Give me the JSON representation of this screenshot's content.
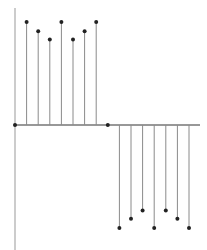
{
  "chart_data": {
    "type": "stem",
    "title": "",
    "xlabel": "",
    "ylabel": "",
    "grid": false,
    "legend": null,
    "x": [
      1,
      2,
      3,
      4,
      5,
      6,
      7,
      8,
      9,
      10,
      11,
      12,
      13,
      14,
      15,
      16
    ],
    "series": [
      {
        "name": "positive",
        "x": [
          2,
          3,
          4,
          5,
          6,
          7,
          8
        ],
        "values": [
          1.0,
          0.91,
          0.83,
          1.0,
          0.83,
          0.91,
          1.0
        ]
      },
      {
        "name": "negative",
        "x": [
          10,
          11,
          12,
          13,
          14,
          15,
          16
        ],
        "values": [
          -1.0,
          -0.91,
          -0.83,
          -1.0,
          -0.83,
          -0.91,
          -1.0
        ]
      },
      {
        "name": "zero-markers",
        "x": [
          1,
          9
        ],
        "values": [
          0,
          0
        ]
      }
    ],
    "ylim": [
      -1.2,
      1.2
    ]
  },
  "colors": {
    "stem": "#8a8a8a",
    "marker": "#222222",
    "axis": "#333333"
  }
}
